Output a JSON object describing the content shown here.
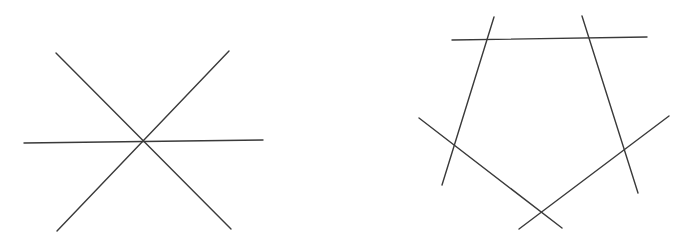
{
  "diagram": {
    "stroke_color": "#3a3a3a",
    "background": "#ffffff",
    "figures": [
      {
        "name": "concurrent-lines",
        "description": "Three lines meeting at a single point",
        "lines": [
          {
            "x1": 56,
            "y1": 53,
            "x2": 231,
            "y2": 229
          },
          {
            "x1": 229,
            "y1": 51,
            "x2": 57,
            "y2": 231
          },
          {
            "x1": 24,
            "y1": 143,
            "x2": 263,
            "y2": 140
          }
        ]
      },
      {
        "name": "pentagon-lines",
        "description": "Five lines forming a pentagon with extended sides",
        "lines": [
          {
            "x1": 452,
            "y1": 40,
            "x2": 647,
            "y2": 37
          },
          {
            "x1": 494,
            "y1": 17,
            "x2": 442,
            "y2": 185
          },
          {
            "x1": 582,
            "y1": 16,
            "x2": 638,
            "y2": 193
          },
          {
            "x1": 419,
            "y1": 118,
            "x2": 562,
            "y2": 228
          },
          {
            "x1": 669,
            "y1": 116,
            "x2": 519,
            "y2": 229
          }
        ]
      }
    ]
  }
}
